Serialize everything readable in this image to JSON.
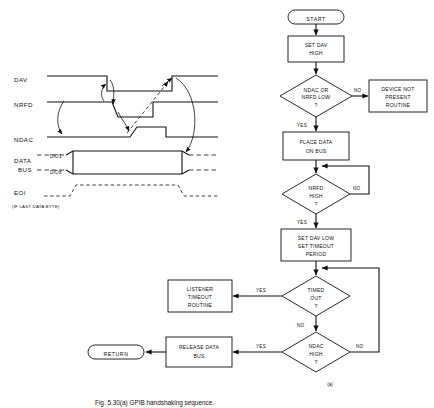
{
  "figure": {
    "caption": "Fig. 5.30(a) GPIB handshaking sequence.",
    "sublabel_a": "(a)"
  },
  "timing_diagram": {
    "signals": [
      {
        "id": "dav",
        "label": "DAV"
      },
      {
        "id": "nrfd",
        "label": "NRFD"
      },
      {
        "id": "ndac",
        "label": "NDAC"
      },
      {
        "id": "data",
        "label_line1": "DATA",
        "label_line2": "BUS",
        "sub_top": "DIO1",
        "sub_bottom": "DIO8"
      },
      {
        "id": "eoi",
        "label": "EOI",
        "note": "(IF LAST DATA BYTE)"
      }
    ]
  },
  "flowchart": {
    "nodes": [
      {
        "id": "start",
        "type": "terminator",
        "text": "START"
      },
      {
        "id": "set-dav-high",
        "type": "process",
        "line1": "SET DAV",
        "line2": "HIGH"
      },
      {
        "id": "ndac-nrfd-low",
        "type": "decision",
        "line1": "NDAC OR",
        "line2": "NRFD LOW",
        "line3": "?"
      },
      {
        "id": "device-not-present",
        "type": "process",
        "line1": "DEVICE NOT",
        "line2": "PRESENT",
        "line3": "ROUTINE"
      },
      {
        "id": "place-data",
        "type": "process",
        "line1": "PLACE DATA",
        "line2": "ON BUS"
      },
      {
        "id": "nrfd-high",
        "type": "decision",
        "line1": "NRFD",
        "line2": "HIGH",
        "line3": "?"
      },
      {
        "id": "set-dav-low",
        "type": "process",
        "line1": "SET DAV LOW",
        "line2": "SET TIMEOUT",
        "line3": "PERIOD"
      },
      {
        "id": "timed-out",
        "type": "decision",
        "line1": "TIMED",
        "line2": "OUT",
        "line3": "?"
      },
      {
        "id": "listener-timeout",
        "type": "process",
        "line1": "LISTENER",
        "line2": "TIMEOUT",
        "line3": "ROUTINE"
      },
      {
        "id": "ndac-high",
        "type": "decision",
        "line1": "NDAC",
        "line2": "HIGH",
        "line3": "?"
      },
      {
        "id": "release-data",
        "type": "process",
        "line1": "RELEASE DATA",
        "line2": "BUS"
      },
      {
        "id": "return",
        "type": "terminator",
        "text": "RETURN"
      }
    ],
    "branch_labels": {
      "ndac_nrfd_low_no": "NO",
      "ndac_nrfd_low_yes": "YES",
      "nrfd_high_no": "NO",
      "nrfd_high_yes": "YES",
      "timed_out_yes": "YES",
      "timed_out_no": "NO",
      "ndac_high_yes": "YES",
      "ndac_high_no": "NO"
    }
  },
  "colors": {
    "ink": "#111111",
    "paper": "#ffffff"
  }
}
